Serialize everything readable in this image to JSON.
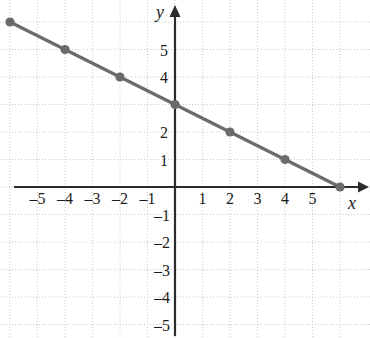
{
  "figure": {
    "title": "",
    "background_color": "#ffffff",
    "axis_color": "#2b2b2b",
    "grid_color": "#c9c9c9",
    "series_color": "#6b6b6b",
    "point_color": "#6b6b6b"
  },
  "axes": {
    "x_axis_label": "x",
    "y_axis_label": "y",
    "x_ticks": [
      "-5",
      "-4",
      "-3",
      "-2",
      "-1",
      "1",
      "2",
      "3",
      "4",
      "5"
    ],
    "y_ticks": [
      "5",
      "4",
      "2",
      "1",
      "-1",
      "-2",
      "-3",
      "-4",
      "-5"
    ],
    "x_tick_values": [
      -5,
      -4,
      -3,
      -2,
      -1,
      1,
      2,
      3,
      4,
      5
    ],
    "y_tick_values": [
      5,
      4,
      2,
      1,
      -1,
      -2,
      -3,
      -4,
      -5
    ],
    "x_arrow": "right-arrow-icon",
    "y_arrow": "up-arrow-icon"
  },
  "chart_data": {
    "type": "line",
    "title": "",
    "xlabel": "x",
    "ylabel": "y",
    "xlim": [
      -6.6,
      6.6
    ],
    "ylim": [
      -5.6,
      6.4
    ],
    "grid": true,
    "grid_style": "dotted",
    "legend": false,
    "series": [
      {
        "name": "y = -0.5x + 3",
        "slope": -0.5,
        "intercept": 3,
        "marker": "filled-circle",
        "x": [
          -6,
          -4,
          -2,
          0,
          2,
          4,
          6
        ],
        "y": [
          6,
          5,
          4,
          3,
          2,
          1,
          0
        ],
        "points": [
          {
            "x": -6,
            "y": 6
          },
          {
            "x": -4,
            "y": 5
          },
          {
            "x": -2,
            "y": 4
          },
          {
            "x": 0,
            "y": 3
          },
          {
            "x": 2,
            "y": 2
          },
          {
            "x": 4,
            "y": 1
          },
          {
            "x": 6,
            "y": 0
          }
        ]
      }
    ]
  }
}
